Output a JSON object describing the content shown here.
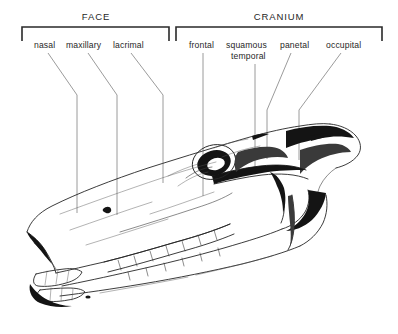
{
  "figure": {
    "background_color": "#ffffff",
    "ink_color": "#1a1a1a",
    "leader_color": "#7a7a7a",
    "bracket_color": "#2a2a2a"
  },
  "groups": [
    {
      "id": "face",
      "label": "FACE",
      "bracket": {
        "x_start": 22,
        "x_end": 169,
        "y_top": 27,
        "tick_depth": 14
      },
      "label_x": 96,
      "label_y": 20
    },
    {
      "id": "cranium",
      "label": "CRANIUM",
      "bracket": {
        "x_start": 176,
        "x_end": 382,
        "y_top": 27,
        "tick_depth": 14
      },
      "label_x": 279,
      "label_y": 20
    }
  ],
  "labels": [
    {
      "id": "nasal",
      "text": "nasal",
      "group": "face",
      "text_x": 34,
      "text_y": 48,
      "leader": "M 48,53 L 77,95 L 77,213"
    },
    {
      "id": "maxillary",
      "text": "maxillary",
      "group": "face",
      "text_x": 66,
      "text_y": 48,
      "leader": "M 88,53 L 117,95 L 117,215"
    },
    {
      "id": "lacrimal",
      "text": "lacrimal",
      "group": "face",
      "text_x": 113,
      "text_y": 48,
      "leader": "M 131,53 L 163,95 L 163,183"
    },
    {
      "id": "frontal",
      "text": "frontal",
      "group": "cranium",
      "text_x": 189,
      "text_y": 48,
      "leader": "M 203,53 L 203,196"
    },
    {
      "id": "squamous-temporal",
      "text": "squamous",
      "text_line2": "temporal",
      "group": "cranium",
      "text_x": 226,
      "text_y": 48,
      "text2_x": 231,
      "text2_y": 59,
      "leader": "M 255,64 L 255,170"
    },
    {
      "id": "parietal",
      "text": "panetal",
      "group": "cranium",
      "text_x": 280,
      "text_y": 48,
      "leader": "M 291,53 L 267,110 L 267,159"
    },
    {
      "id": "occipital",
      "text": "occupital",
      "group": "cranium",
      "text_x": 326,
      "text_y": 48,
      "leader": "M 341,53 L 299,110 L 299,160"
    }
  ],
  "illustration": {
    "kind": "line-drawing",
    "description": "Lateral view engraving of an equine skull, nose to the lower left, occiput and mandible ramus to the right, showing orbit, zygomatic arch, nasal bone, maxilla with upper cheek teeth row, mandible with lower cheek teeth and incisors.",
    "bounds": {
      "x": 22,
      "y": 118,
      "width": 348,
      "height": 200
    }
  }
}
